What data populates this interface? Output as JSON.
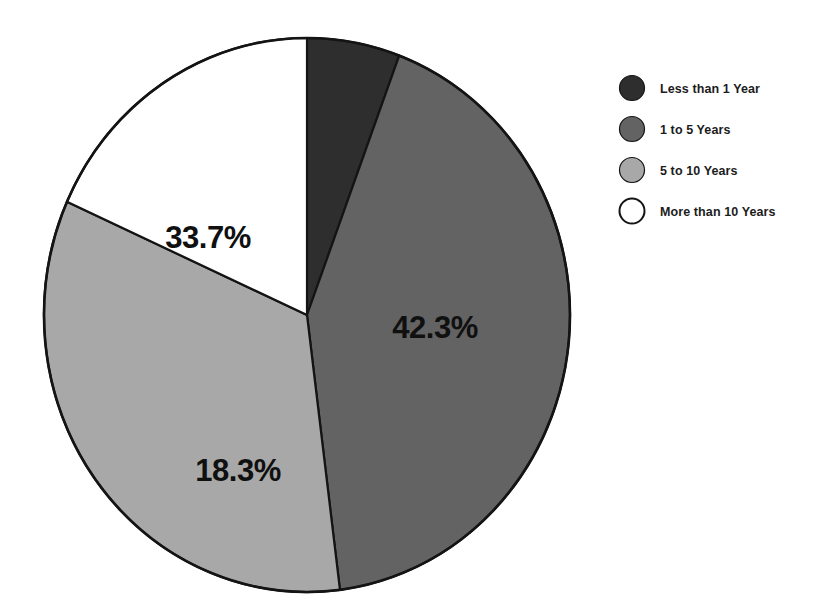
{
  "chart_data": {
    "type": "pie",
    "title": "",
    "subtitle": "",
    "xlabel": "",
    "ylabel": "",
    "grid": false,
    "legend_position": "right",
    "categories": [
      "Less than 1 Year",
      "1 to 5 Years",
      "5 to 10 Years",
      "More than 10 Years"
    ],
    "values": [
      5.7,
      42.3,
      33.7,
      18.3
    ],
    "value_unit": "%",
    "start_angle_deg": 0,
    "direction": "clockwise",
    "slices": [
      {
        "label": "Less than 1 Year",
        "value": 5.7,
        "display_value": "",
        "color": "#2e2e2e",
        "label_shown": false
      },
      {
        "label": "1 to 5 Years",
        "value": 42.3,
        "display_value": "42.3%",
        "color": "#636363",
        "label_shown": true
      },
      {
        "label": "5 to 10 Years",
        "value": 33.7,
        "display_value": "33.7%",
        "color": "#a8a8a8",
        "label_shown": true
      },
      {
        "label": "More than 10 Years",
        "value": 18.3,
        "display_value": "18.3%",
        "color": "#ffffff",
        "label_shown": true
      }
    ],
    "data_labels": [
      "42.3%",
      "18.3%",
      "33.7%"
    ],
    "annotations": []
  },
  "pie": {
    "center_x": 307,
    "center_y": 315,
    "radius_x": 263,
    "radius_y": 277,
    "outline_color": "#141414",
    "labels": {
      "share_1_to_5": "42.3%",
      "share_5_to_10": "33.7%",
      "share_more_than_10": "18.3%"
    }
  },
  "legend": {
    "items": [
      {
        "label": "Less than 1 Year",
        "color": "#2e2e2e",
        "marker": "filled-circle-marker"
      },
      {
        "label": "1 to 5 Years",
        "color": "#636363",
        "marker": "filled-circle-marker"
      },
      {
        "label": "5 to 10 Years",
        "color": "#a8a8a8",
        "marker": "filled-circle-marker"
      },
      {
        "label": "More than 10 Years",
        "color": "#ffffff",
        "marker": "outline-circle-marker"
      }
    ]
  },
  "colors": {
    "background": "#ffffff",
    "slice_dark": "#2e2e2e",
    "slice_medium": "#636363",
    "slice_light": "#a8a8a8",
    "slice_white": "#ffffff",
    "stroke": "#141414",
    "text": "#101010"
  }
}
